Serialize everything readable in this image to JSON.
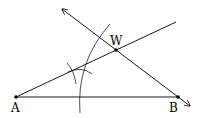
{
  "diagram": {
    "type": "geometric-construction",
    "points": [
      {
        "id": "A",
        "label": "A",
        "x": 16,
        "y": 97
      },
      {
        "id": "B",
        "label": "B",
        "x": 178,
        "y": 97
      },
      {
        "id": "W",
        "label": "W",
        "x": 116,
        "y": 50
      }
    ],
    "labels": {
      "A": "A",
      "B": "B",
      "W": "W"
    },
    "segments": [
      {
        "from": "A",
        "to": "B",
        "description": "segment AB"
      },
      {
        "from": "A",
        "to": "W",
        "description": "angle bisector ray from A through W"
      },
      {
        "from": "W",
        "to": "B",
        "description": "line through W and B with arrows at both ends"
      }
    ],
    "arcs": [
      "large construction arc crossing AW and AB",
      "two small intersecting arcs near the bisector"
    ]
  }
}
